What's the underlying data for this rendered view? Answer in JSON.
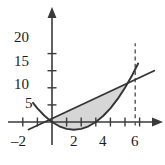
{
  "figure": {
    "title": "",
    "background_color": "#ffffff",
    "axis_color": "#3a3a3a",
    "curve_color": "#333333",
    "shade_color": "#d4d4d4",
    "dashed_color": "#555555"
  },
  "labels": {
    "y": [
      {
        "text": "20",
        "value": 20
      },
      {
        "text": "15",
        "value": 15
      },
      {
        "text": "10",
        "value": 10
      },
      {
        "text": "5",
        "value": 5
      }
    ],
    "x": [
      {
        "text": "–2",
        "value": -2
      },
      {
        "text": "2",
        "value": 2
      },
      {
        "text": "4",
        "value": 4
      },
      {
        "text": "6",
        "value": 6
      }
    ]
  },
  "chart_data": {
    "type": "line",
    "title": "",
    "xlabel": "",
    "ylabel": "",
    "xlim": [
      -3,
      7.5
    ],
    "ylim": [
      -4,
      24
    ],
    "grid": false,
    "legend": "none",
    "x_ticks": [
      -2,
      -1,
      1,
      2,
      3,
      4,
      5,
      6
    ],
    "x_tick_labels": [
      "–2",
      "",
      "",
      "2",
      "",
      "4",
      "",
      "6"
    ],
    "y_ticks": [
      5,
      10,
      15,
      20
    ],
    "y_tick_labels": [
      "5",
      "10",
      "15",
      "20"
    ],
    "series": [
      {
        "name": "parabola",
        "type": "curve",
        "equation": "y = x^2 - 3x",
        "style": "solid",
        "x_range": [
          -1.3,
          5.9
        ],
        "points": [
          {
            "x": -1.3,
            "y": 5.6
          },
          {
            "x": -1.0,
            "y": 4.0
          },
          {
            "x": -0.5,
            "y": 1.75
          },
          {
            "x": 0.0,
            "y": 0.0
          },
          {
            "x": 0.5,
            "y": -1.25
          },
          {
            "x": 1.0,
            "y": -2.0
          },
          {
            "x": 1.5,
            "y": -2.25
          },
          {
            "x": 2.0,
            "y": -2.0
          },
          {
            "x": 2.5,
            "y": -1.25
          },
          {
            "x": 3.0,
            "y": 0.0
          },
          {
            "x": 3.5,
            "y": 1.75
          },
          {
            "x": 4.0,
            "y": 4.0
          },
          {
            "x": 4.5,
            "y": 6.75
          },
          {
            "x": 5.0,
            "y": 10.0
          },
          {
            "x": 5.5,
            "y": 13.75
          },
          {
            "x": 5.9,
            "y": 17.1
          }
        ]
      },
      {
        "name": "line",
        "type": "line",
        "equation": "y = 2x + 1",
        "style": "solid",
        "x_range": [
          -1.6,
          7.0
        ],
        "points": [
          {
            "x": -1.6,
            "y": -2.2
          },
          {
            "x": 7.0,
            "y": 15.0
          }
        ]
      },
      {
        "name": "vertical-dashed",
        "type": "vline",
        "style": "dashed",
        "x": 5.7,
        "y_range": [
          -1.0,
          23.0
        ]
      }
    ],
    "shaded_region": {
      "between": [
        "line",
        "parabola"
      ],
      "x_from": -0.3,
      "x_to": 5.0,
      "color": "#d4d4d4"
    },
    "intersections": [
      {
        "x": -0.3,
        "y": 0.4
      },
      {
        "x": 5.0,
        "y": 11.5
      }
    ]
  }
}
